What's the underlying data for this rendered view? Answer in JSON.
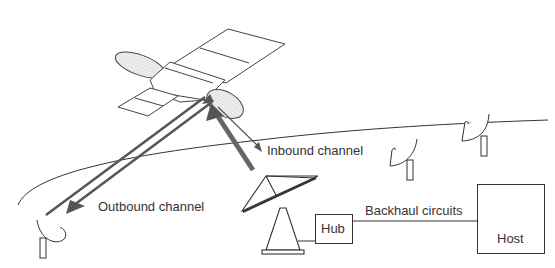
{
  "diagram": {
    "type": "satellite-network",
    "nodes": {
      "satellite": "satellite",
      "hub_dish": "hub earth station antenna",
      "remote_terminals": 3,
      "hub": "Hub",
      "host": "Host"
    },
    "labels": {
      "inbound": "Inbound channel",
      "outbound": "Outbound channel",
      "backhaul": "Backhaul circuits",
      "hub": "Hub",
      "host": "Host"
    },
    "edges": [
      {
        "from": "hub_dish",
        "to": "satellite",
        "label": "Inbound channel"
      },
      {
        "from": "satellite",
        "to": "remote_terminal",
        "label": "Outbound channel"
      },
      {
        "from": "hub",
        "to": "host",
        "label": "Backhaul circuits"
      }
    ],
    "colors": {
      "line": "#333333",
      "fill": "#e6e6e6",
      "arrow": "#555555"
    }
  }
}
